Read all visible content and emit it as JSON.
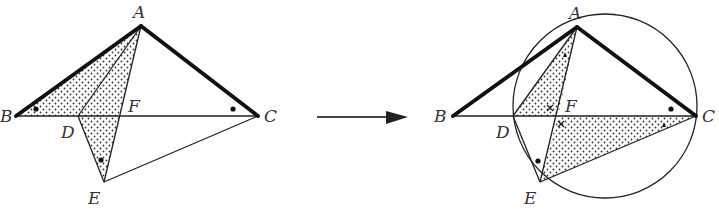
{
  "figure": {
    "left": {
      "labels": {
        "A": "A",
        "B": "B",
        "C": "C",
        "D": "D",
        "E": "E",
        "F": "F"
      },
      "markers": [
        "dot at angle B",
        "dot at angle C",
        "dot at angle E"
      ]
    },
    "arrow": {
      "direction": "right"
    },
    "right": {
      "labels": {
        "A": "A",
        "B": "B",
        "C": "C",
        "D": "D",
        "E": "E",
        "F": "F"
      },
      "circle": "circumcircle through A, D, E, C",
      "markers": [
        "triangle at angle DAF",
        "triangle at angle FCE",
        "cross at angle DFA",
        "cross at angle EFC",
        "dot at angle ACB",
        "dot at angle DEA"
      ]
    }
  }
}
